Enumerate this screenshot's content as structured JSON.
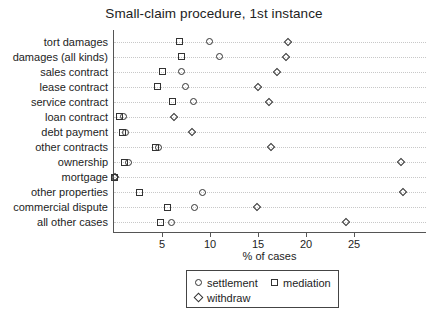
{
  "chart_data": {
    "type": "scatter",
    "title": "Small-claim procedure, 1st instance",
    "xlabel": "% of cases",
    "ylabel": "",
    "grid": true,
    "orientation": "horizontal",
    "xlim": [
      0,
      32.5
    ],
    "xticks": [
      5,
      10,
      15,
      20,
      25
    ],
    "xticklabels": [
      "5",
      "10",
      "15",
      "20",
      "25"
    ],
    "legend_position": "below-center",
    "categories": [
      "tort damages",
      "damages (all kinds)",
      "sales contract",
      "lease contract",
      "service contract",
      "loan contract",
      "debt payment",
      "other contracts",
      "ownership",
      "mortgage",
      "other properties",
      "commercial dispute",
      "all other cases"
    ],
    "series": [
      {
        "name": "settlement",
        "marker": "circle",
        "values": [
          9.9,
          11.0,
          7.0,
          7.4,
          8.3,
          1.0,
          1.2,
          4.6,
          1.5,
          0.1,
          9.2,
          8.4,
          6.0
        ]
      },
      {
        "name": "mediation",
        "marker": "square",
        "values": [
          6.8,
          7.0,
          5.1,
          4.5,
          6.1,
          0.6,
          0.9,
          4.3,
          1.1,
          0.0,
          2.7,
          5.6,
          4.8
        ]
      },
      {
        "name": "withdraw",
        "marker": "diamond",
        "values": [
          18.1,
          17.9,
          17.0,
          15.0,
          16.1,
          6.3,
          8.1,
          16.4,
          29.9,
          0.1,
          30.1,
          14.9,
          24.2
        ]
      }
    ]
  },
  "legend": {
    "items": [
      {
        "label": "settlement",
        "marker": "circle"
      },
      {
        "label": "mediation",
        "marker": "square"
      },
      {
        "label": "withdraw",
        "marker": "diamond"
      }
    ]
  }
}
